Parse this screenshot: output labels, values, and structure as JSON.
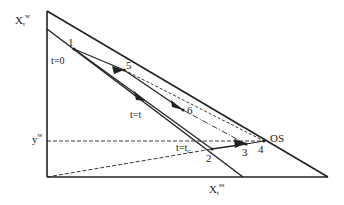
{
  "diagram": {
    "axis_labels": {
      "y_axis": {
        "base": "X",
        "sub": "t",
        "sup": "w"
      },
      "x_axis": {
        "base": "X",
        "sub": "t",
        "sup": "ss"
      },
      "y_w": {
        "base": "y",
        "sup": "w"
      }
    },
    "time_labels": {
      "t0": "t=0",
      "tt": "t=t",
      "tc": {
        "base": "t=t",
        "sub": "c"
      }
    },
    "points": [
      {
        "id": "1",
        "label": "1",
        "x": 74,
        "y": 49
      },
      {
        "id": "2",
        "label": "2",
        "x": 212,
        "y": 149
      },
      {
        "id": "3",
        "label": "3",
        "x": 246,
        "y": 144
      },
      {
        "id": "4",
        "label": "4",
        "x": 258,
        "y": 142
      },
      {
        "id": "5",
        "label": "5",
        "x": 124,
        "y": 70
      },
      {
        "id": "6",
        "label": "6",
        "x": 183,
        "y": 110
      },
      {
        "id": "OS",
        "label": "OS",
        "x": 264,
        "y": 141
      }
    ],
    "colors": {
      "line": "#222222",
      "background": "#ffffff"
    }
  }
}
